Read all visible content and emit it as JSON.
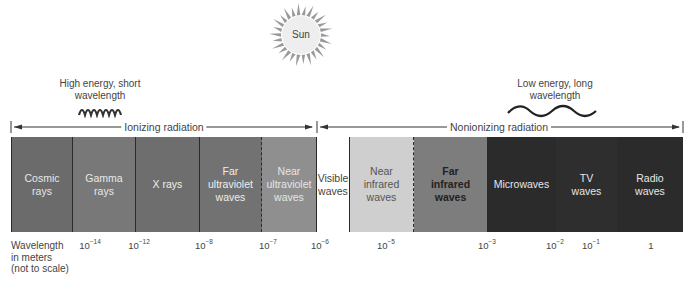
{
  "sun": {
    "label": "Sun"
  },
  "energy_labels": {
    "high": {
      "line1": "High energy, short",
      "line2": "wavelength"
    },
    "low": {
      "line1": "Low energy, long",
      "line2": "wavelength"
    }
  },
  "ranges": {
    "ionizing": "Ionizing radiation",
    "nonionizing": "Nonionizing radiation"
  },
  "bands": [
    {
      "line1": "Cosmic",
      "line2": "rays",
      "line3": "",
      "color": "#6b6b6b",
      "text_color": "#e8e8e8"
    },
    {
      "line1": "Gamma",
      "line2": "rays",
      "line3": "",
      "color": "#787878",
      "text_color": "#e8e8e8"
    },
    {
      "line1": "X rays",
      "line2": "",
      "line3": "",
      "color": "#6e6e6e",
      "text_color": "#eeeeee"
    },
    {
      "line1": "Far",
      "line2": "ultraviolet",
      "line3": "waves",
      "color": "#727272",
      "text_color": "#eeeeee"
    },
    {
      "line1": "Near",
      "line2": "ultraviolet",
      "line3": "waves",
      "color": "#8f8f8f",
      "text_color": "#e6e6e6"
    },
    {
      "line1": "Visible",
      "line2": "waves",
      "line3": "",
      "color": "#ffffff",
      "text_color": "#444444"
    },
    {
      "line1": "Near",
      "line2": "infrared",
      "line3": "waves",
      "color": "#cfcfcf",
      "text_color": "#555555"
    },
    {
      "line1": "Far",
      "line2": "infrared",
      "line3": "waves",
      "color": "#7d7d7d",
      "text_color": "#222222"
    },
    {
      "line1": "Microwaves",
      "line2": "",
      "line3": "",
      "color": "#2b2b2b",
      "text_color": "#e6e6e6"
    },
    {
      "line1": "TV",
      "line2": "waves",
      "line3": "",
      "color": "#2e2e2e",
      "text_color": "#e6e6e6"
    },
    {
      "line1": "Radio",
      "line2": "waves",
      "line3": "",
      "color": "#2b2b2b",
      "text_color": "#e6e6e6"
    }
  ],
  "axis": {
    "label_line1": "Wavelength",
    "label_line2": "in meters",
    "label_line3": "(not to scale)",
    "ticks": [
      {
        "base": "10",
        "exp": "−14"
      },
      {
        "base": "10",
        "exp": "−12"
      },
      {
        "base": "10",
        "exp": "−8"
      },
      {
        "base": "10",
        "exp": "−7"
      },
      {
        "base": "10",
        "exp": "−6"
      },
      {
        "base": "10",
        "exp": "−5"
      },
      {
        "base": "10",
        "exp": "−3"
      },
      {
        "base": "10",
        "exp": "−2"
      },
      {
        "base": "10",
        "exp": "−1"
      },
      {
        "base": "1",
        "exp": ""
      }
    ]
  }
}
